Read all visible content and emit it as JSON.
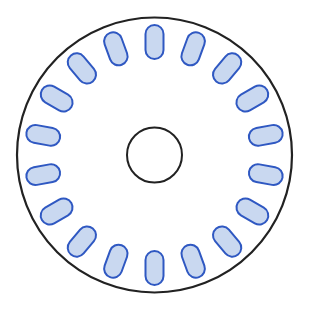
{
  "diagram": {
    "center": [
      154.5,
      155
    ],
    "outer_radius": 137.5,
    "inner_radius": 27.5,
    "slot_count": 18,
    "slot_radius": 113,
    "slot_length": 34,
    "slot_width": 18,
    "slot_start_angle_deg": 10,
    "colors": {
      "outline": "#222222",
      "slot_fill": "#c9d8f0",
      "slot_stroke": "#2f58c2",
      "background": "#ffffff"
    }
  },
  "caption": "(faded, illegible text)"
}
